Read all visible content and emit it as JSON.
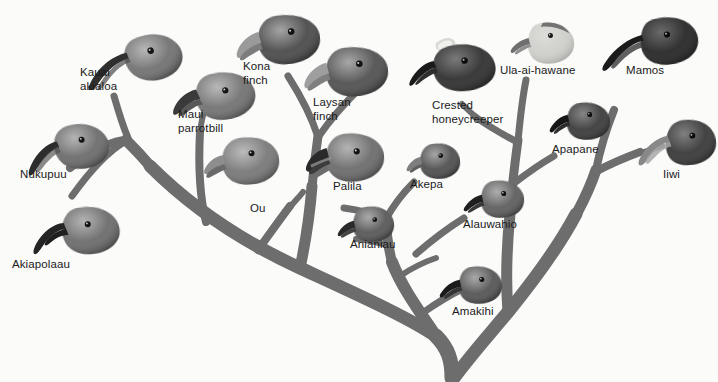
{
  "figure": {
    "type": "phylogenetic-tree-illustration",
    "background_color": "#fbfbfa",
    "branch_color": "#6d6d6d",
    "label_color": "#1a1a1a"
  },
  "taxa": [
    {
      "id": "kauai-akialoa",
      "label": "Kauai\nakialoa",
      "label_x": 80,
      "label_y": 66,
      "bird_x": 78,
      "bird_y": 18,
      "bird_w": 115,
      "bird_h": 72,
      "bill": "very-long-decurved",
      "bill_len": 62,
      "bill_curve": 34,
      "head_tone": "#6f6f6f",
      "rotate": -14,
      "flip": false
    },
    {
      "id": "nukupuu",
      "label": "Nukupuu",
      "label_x": 20,
      "label_y": 168,
      "bird_x": 24,
      "bird_y": 112,
      "bird_w": 92,
      "bird_h": 64,
      "bill": "long-decurved",
      "bill_len": 44,
      "bill_curve": 26,
      "head_tone": "#6a6a6a",
      "rotate": -6,
      "flip": false
    },
    {
      "id": "akiapolaau",
      "label": "Akiapolaau",
      "label_x": 12,
      "label_y": 258,
      "bird_x": 30,
      "bird_y": 196,
      "bird_w": 96,
      "bird_h": 64,
      "bill": "hooked-upper-long",
      "bill_len": 40,
      "bill_curve": 22,
      "head_tone": "#6a6a6a",
      "rotate": -4,
      "flip": false
    },
    {
      "id": "maui-parrotbill",
      "label": "Maui\nparrotbill",
      "label_x": 178,
      "label_y": 108,
      "bird_x": 168,
      "bird_y": 66,
      "bird_w": 92,
      "bird_h": 60,
      "bill": "heavy-hooked",
      "bill_len": 22,
      "bill_curve": 12,
      "head_tone": "#717171",
      "rotate": -8,
      "flip": false
    },
    {
      "id": "kona-finch",
      "label": "Kona\nfinch",
      "label_x": 243,
      "label_y": 60,
      "bird_x": 232,
      "bird_y": 10,
      "bird_w": 92,
      "bird_h": 60,
      "bill": "conical-massive",
      "bill_len": 20,
      "bill_curve": 4,
      "head_tone": "#4a4a4a",
      "rotate": -6,
      "flip": false
    },
    {
      "id": "ou",
      "label": "Ou",
      "label_x": 250,
      "label_y": 202,
      "bird_x": 198,
      "bird_y": 130,
      "bird_w": 86,
      "bird_h": 60,
      "bill": "stubby-hooked",
      "bill_len": 16,
      "bill_curve": 8,
      "head_tone": "#777777",
      "rotate": -4,
      "flip": false
    },
    {
      "id": "laysan-finch",
      "label": "Laysan\nfinch",
      "label_x": 313,
      "label_y": 96,
      "bird_x": 300,
      "bird_y": 42,
      "bird_w": 92,
      "bird_h": 60,
      "bill": "conical-massive",
      "bill_len": 20,
      "bill_curve": 3,
      "head_tone": "#4f4f4f",
      "rotate": -5,
      "flip": false
    },
    {
      "id": "palila",
      "label": "Palila",
      "label_x": 333,
      "label_y": 180,
      "bird_x": 302,
      "bird_y": 128,
      "bird_w": 86,
      "bird_h": 58,
      "bill": "conical-massive",
      "bill_len": 19,
      "bill_curve": 3,
      "head_tone": "#6a6a6a",
      "rotate": -3,
      "flip": false
    },
    {
      "id": "anianiau",
      "label": "Anianiau",
      "label_x": 350,
      "label_y": 238,
      "bird_x": 336,
      "bird_y": 202,
      "bird_w": 62,
      "bird_h": 44,
      "bill": "short-slight-decurved",
      "bill_len": 12,
      "bill_curve": 6,
      "head_tone": "#575757",
      "rotate": -3,
      "flip": false
    },
    {
      "id": "akepa",
      "label": "Akepa",
      "label_x": 410,
      "label_y": 178,
      "bird_x": 404,
      "bird_y": 140,
      "bird_w": 60,
      "bird_h": 42,
      "bill": "short-crossed",
      "bill_len": 11,
      "bill_curve": 4,
      "head_tone": "#4d4d4d",
      "rotate": -3,
      "flip": false
    },
    {
      "id": "crested-honeycreeper",
      "label": "Crested\nhoneycreeper",
      "label_x": 432,
      "label_y": 99,
      "bird_x": 404,
      "bird_y": 34,
      "bird_w": 96,
      "bird_h": 62,
      "bill": "medium-decurved-crested",
      "bill_len": 26,
      "bill_curve": 14,
      "head_tone": "#303030",
      "rotate": -6,
      "flip": false
    },
    {
      "id": "alauwahio",
      "label": "Alauwahio",
      "label_x": 463,
      "label_y": 218,
      "bird_x": 462,
      "bird_y": 176,
      "bird_w": 66,
      "bird_h": 46,
      "bill": "short-slight-decurved",
      "bill_len": 14,
      "bill_curve": 7,
      "head_tone": "#5c5c5c",
      "rotate": -3,
      "flip": false
    },
    {
      "id": "amakihi",
      "label": "Amakihi",
      "label_x": 452,
      "label_y": 305,
      "bird_x": 438,
      "bird_y": 262,
      "bird_w": 68,
      "bird_h": 46,
      "bill": "medium-decurved",
      "bill_len": 20,
      "bill_curve": 11,
      "head_tone": "#535353",
      "rotate": -3,
      "flip": false
    },
    {
      "id": "ula-ai-hawane",
      "label": "Ula-ai-hawane",
      "label_x": 500,
      "label_y": 64,
      "bird_x": 508,
      "bird_y": 18,
      "bird_w": 70,
      "bird_h": 50,
      "bill": "short-conical",
      "bill_len": 13,
      "bill_curve": 4,
      "head_tone": "#cfcfcb",
      "rotate": -4,
      "flip": false
    },
    {
      "id": "apapane",
      "label": "Apapane",
      "label_x": 552,
      "label_y": 143,
      "bird_x": 548,
      "bird_y": 98,
      "bird_w": 66,
      "bird_h": 46,
      "bill": "medium-decurved",
      "bill_len": 20,
      "bill_curve": 10,
      "head_tone": "#3d3d3d",
      "rotate": -3,
      "flip": false
    },
    {
      "id": "mamos",
      "label": "Mamos",
      "label_x": 626,
      "label_y": 64,
      "bird_x": 596,
      "bird_y": 14,
      "bird_w": 108,
      "bird_h": 58,
      "bill": "long-decurved",
      "bill_len": 46,
      "bill_curve": 24,
      "head_tone": "#2b2b2b",
      "rotate": -8,
      "flip": false
    },
    {
      "id": "iiwi",
      "label": "Iiwi",
      "label_x": 663,
      "label_y": 168,
      "bird_x": 636,
      "bird_y": 116,
      "bird_w": 82,
      "bird_h": 54,
      "bill": "long-decurved",
      "bill_len": 34,
      "bill_curve": 20,
      "head_tone": "#3a3a3a",
      "rotate": -5,
      "flip": false
    }
  ],
  "branches": {
    "trunk_base_x": 452,
    "trunk_base_y": 374,
    "description": "Single trunk at bottom center splitting into a left limb and a right limb, each subdividing into the terminal twigs that carry the bird heads."
  }
}
